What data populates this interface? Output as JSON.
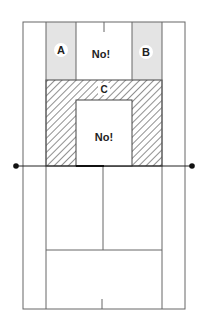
{
  "diagram": {
    "zones": {
      "A": {
        "label": "A"
      },
      "B": {
        "label": "B"
      },
      "C": {
        "label": "C"
      },
      "no_top": {
        "label": "No!"
      },
      "no_mid": {
        "label": "No!"
      }
    },
    "colors": {
      "line": "#555555",
      "shaded": "#e4e4e4",
      "hatch": "#333333",
      "background": "#ffffff",
      "post": "#111111"
    }
  }
}
